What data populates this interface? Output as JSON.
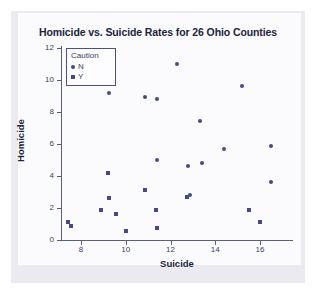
{
  "chart_data": {
    "type": "scatter",
    "title": "Homicide vs. Suicide Rates for 26 Ohio Counties",
    "xlabel": "Suicide",
    "ylabel": "Homicide",
    "xlim": [
      7.0,
      17.0
    ],
    "ylim": [
      0,
      12.4
    ],
    "xticks": [
      "8",
      "10",
      "12",
      "14",
      "16"
    ],
    "xtick_values": [
      8,
      10,
      12,
      14,
      16
    ],
    "yticks": [
      "0",
      "2",
      "4",
      "6",
      "8",
      "10",
      "12"
    ],
    "ytick_values": [
      0,
      2,
      4,
      6,
      8,
      10,
      12
    ],
    "grid": false,
    "legend": {
      "title": "Caution",
      "position": "top-left-inside",
      "entries": [
        {
          "label": "N",
          "marker": "circle"
        },
        {
          "label": "Y",
          "marker": "square"
        }
      ]
    },
    "series": [
      {
        "name": "N",
        "marker": "circle",
        "color": "#454a84",
        "points": [
          {
            "x": 9.25,
            "y": 9.2
          },
          {
            "x": 10.85,
            "y": 8.95
          },
          {
            "x": 11.4,
            "y": 8.8
          },
          {
            "x": 12.3,
            "y": 11.0
          },
          {
            "x": 15.2,
            "y": 9.6
          },
          {
            "x": 13.3,
            "y": 7.45
          },
          {
            "x": 14.4,
            "y": 5.7
          },
          {
            "x": 16.5,
            "y": 5.9
          },
          {
            "x": 11.4,
            "y": 5.0
          },
          {
            "x": 12.8,
            "y": 4.6
          },
          {
            "x": 13.4,
            "y": 4.8
          },
          {
            "x": 16.5,
            "y": 3.6
          },
          {
            "x": 12.85,
            "y": 2.8
          }
        ]
      },
      {
        "name": "Y",
        "marker": "square",
        "color": "#454a84",
        "points": [
          {
            "x": 7.4,
            "y": 1.1
          },
          {
            "x": 7.55,
            "y": 0.85
          },
          {
            "x": 8.9,
            "y": 1.85
          },
          {
            "x": 9.2,
            "y": 4.2
          },
          {
            "x": 9.25,
            "y": 2.65
          },
          {
            "x": 9.55,
            "y": 1.65
          },
          {
            "x": 10.0,
            "y": 0.55
          },
          {
            "x": 10.85,
            "y": 3.15
          },
          {
            "x": 11.35,
            "y": 1.9
          },
          {
            "x": 11.4,
            "y": 0.75
          },
          {
            "x": 12.75,
            "y": 2.7
          },
          {
            "x": 15.5,
            "y": 1.9
          },
          {
            "x": 16.0,
            "y": 1.15
          }
        ]
      }
    ],
    "total_points": 26
  }
}
